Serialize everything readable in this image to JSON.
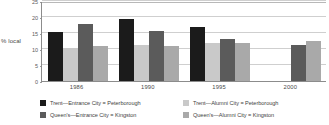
{
  "chart_data": {
    "type": "bar",
    "title": "",
    "xlabel": "",
    "ylabel": "% local",
    "categories": [
      "1986",
      "1990",
      "1995",
      "2000"
    ],
    "ylim": [
      0,
      25
    ],
    "yticks": [
      0,
      5,
      10,
      15,
      20,
      25
    ],
    "ytick_labels": [
      "0",
      "5",
      "10",
      "15",
      "20",
      "25"
    ],
    "grid": true,
    "legend_position": "bottom",
    "series": [
      {
        "name": "Trent—Entrance City = Peterborough",
        "color": "#1b1b1b",
        "values": [
          15.3,
          19.5,
          16.8,
          null
        ]
      },
      {
        "name": "Trent—Alumni City = Peterborough",
        "color": "#c9c9c9",
        "values": [
          10.2,
          11.3,
          11.8,
          null
        ]
      },
      {
        "name": "Queen's—Entrance City = Kingston",
        "color": "#5b5b5b",
        "values": [
          17.7,
          15.5,
          13.1,
          11.3
        ]
      },
      {
        "name": "Queen's—Alumni City = Kingston",
        "color": "#a9a9a9",
        "values": [
          10.9,
          10.8,
          11.9,
          12.4
        ]
      }
    ]
  },
  "axis": {
    "y_title": "% local"
  },
  "legend": {
    "items": [
      {
        "label": "Trent—Entrance City = Peterborough",
        "color": "#1b1b1b"
      },
      {
        "label": "Trent—Alumni City = Peterborough",
        "color": "#c9c9c9"
      },
      {
        "label": "Queen's—Entrance City = Kingston",
        "color": "#5b5b5b"
      },
      {
        "label": "Queen's—Alumni City = Kingston",
        "color": "#a9a9a9"
      }
    ]
  }
}
